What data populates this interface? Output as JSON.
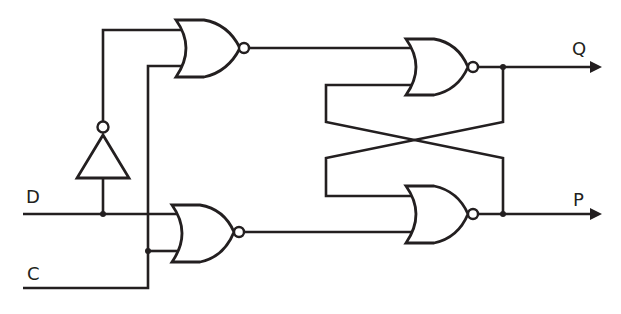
{
  "diagram": {
    "inputs": [
      {
        "id": "D",
        "label": "D"
      },
      {
        "id": "C",
        "label": "C"
      }
    ],
    "outputs": [
      {
        "id": "Q",
        "label": "Q"
      },
      {
        "id": "P",
        "label": "P"
      }
    ],
    "components": [
      {
        "id": "inverter",
        "type": "NOT",
        "input": "D"
      },
      {
        "id": "nor_top_left",
        "type": "NOR",
        "inputs": [
          "NOT D",
          "C"
        ]
      },
      {
        "id": "nor_bottom_left",
        "type": "NOR",
        "inputs": [
          "D",
          "C"
        ]
      },
      {
        "id": "nor_top_right",
        "type": "NOR",
        "inputs": [
          "nor_top_left",
          "P"
        ],
        "output": "Q"
      },
      {
        "id": "nor_bottom_right",
        "type": "NOR",
        "inputs": [
          "Q",
          "nor_bottom_left"
        ],
        "output": "P"
      }
    ],
    "colors": {
      "ink": "#231f20",
      "background": "#ffffff"
    }
  }
}
